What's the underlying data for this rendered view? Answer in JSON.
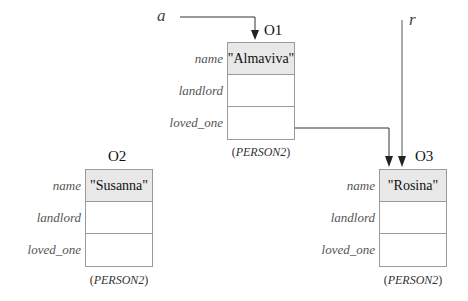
{
  "variables": [
    {
      "id": "a",
      "label": "a",
      "points_to": "O1"
    },
    {
      "id": "r",
      "label": "r",
      "points_to": "O3"
    }
  ],
  "objects": [
    {
      "id": "O1",
      "label": "O1",
      "class_label": "PERSON2",
      "fields": [
        {
          "name": "name",
          "value": "\"Almaviva\""
        },
        {
          "name": "landlord",
          "value": ""
        },
        {
          "name": "loved_one",
          "value": "",
          "reference": "O3"
        }
      ]
    },
    {
      "id": "O2",
      "label": "O2",
      "class_label": "PERSON2",
      "fields": [
        {
          "name": "name",
          "value": "\"Susanna\""
        },
        {
          "name": "landlord",
          "value": ""
        },
        {
          "name": "loved_one",
          "value": ""
        }
      ]
    },
    {
      "id": "O3",
      "label": "O3",
      "class_label": "PERSON2",
      "fields": [
        {
          "name": "name",
          "value": "\"Rosina\""
        },
        {
          "name": "landlord",
          "value": ""
        },
        {
          "name": "loved_one",
          "value": ""
        }
      ]
    }
  ],
  "colors": {
    "name_cell_fill": "#e8e8e8",
    "border": "#9a9a9a",
    "arrow": "#222222"
  }
}
